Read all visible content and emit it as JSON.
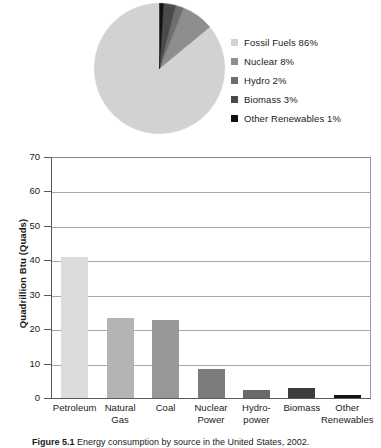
{
  "figure": {
    "caption_number": "Figure 5.1",
    "caption_text": "Energy consumption by source in the United States, 2002."
  },
  "pie": {
    "title": "",
    "legend_position": "right",
    "items": [
      {
        "label": "Fossil Fuels 86%",
        "name": "Fossil Fuels",
        "value": 86,
        "color": "#d2d2d2"
      },
      {
        "label": "Nuclear 8%",
        "name": "Nuclear",
        "value": 8,
        "color": "#8e8e8e"
      },
      {
        "label": "Hydro 2%",
        "name": "Hydro",
        "value": 2,
        "color": "#6e6e6e"
      },
      {
        "label": "Biomass 3%",
        "name": "Biomass",
        "value": 3,
        "color": "#4a4a4a"
      },
      {
        "label": "Other Renewables 1%",
        "name": "Other Renewables",
        "value": 1,
        "color": "#111111"
      }
    ]
  },
  "bar": {
    "ylabel": "Quadrillion Btu (Quads)",
    "yticks": [
      70,
      60,
      50,
      40,
      30,
      20,
      10,
      0
    ],
    "categories": [
      {
        "lines": [
          "Petroleum"
        ]
      },
      {
        "lines": [
          "Natural",
          "Gas"
        ]
      },
      {
        "lines": [
          "Coal"
        ]
      },
      {
        "lines": [
          "Nuclear",
          "Power"
        ]
      },
      {
        "lines": [
          "Hydro-",
          "power"
        ]
      },
      {
        "lines": [
          "Biomass"
        ]
      },
      {
        "lines": [
          "Other",
          "Renewables"
        ]
      }
    ]
  },
  "chart_data": [
    {
      "type": "pie",
      "title": "Energy consumption by source (share)",
      "labels": [
        "Fossil Fuels",
        "Nuclear",
        "Hydro",
        "Biomass",
        "Other Renewables"
      ],
      "values": [
        86,
        8,
        2,
        3,
        1
      ],
      "unit": "percent",
      "legend_entries": [
        "Fossil Fuels 86%",
        "Nuclear 8%",
        "Hydro 2%",
        "Biomass 3%",
        "Other Renewables 1%"
      ],
      "colors": [
        "#d2d2d2",
        "#8e8e8e",
        "#6e6e6e",
        "#4a4a4a",
        "#111111"
      ],
      "legend": "right",
      "start_angle_deg": 0,
      "direction": "counterclockwise"
    },
    {
      "type": "bar",
      "title": "",
      "categories": [
        "Petroleum",
        "Natural Gas",
        "Coal",
        "Nuclear Power",
        "Hydropower",
        "Biomass",
        "Other Renewables"
      ],
      "values": [
        40.9,
        23.2,
        22.6,
        8.5,
        2.4,
        2.9,
        1.0
      ],
      "colors": [
        "#dcdcdc",
        "#b4b4b4",
        "#989898",
        "#7c7c7c",
        "#6a6a6a",
        "#3c3c3c",
        "#141414"
      ],
      "xlabel": "",
      "ylabel": "Quadrillion Btu (Quads)",
      "ylim": [
        0,
        70
      ],
      "ytick_step": 10,
      "yticks": [
        0,
        10,
        20,
        30,
        40,
        50,
        60,
        70
      ],
      "grid": true,
      "grid_axis": "y",
      "legend": "none"
    }
  ]
}
